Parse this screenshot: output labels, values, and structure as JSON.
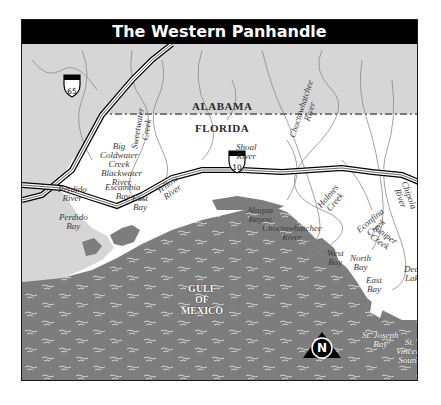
{
  "map": {
    "title": "The Western Panhandle",
    "states": {
      "north": "ALABAMA",
      "south": "FLORIDA"
    },
    "water_body": {
      "line1": "GULF",
      "line2": "OF",
      "line3": "MEXICO"
    },
    "highways": [
      {
        "id": "i65",
        "label": "65",
        "icon": "interstate-shield-icon"
      },
      {
        "id": "i10",
        "label": "10",
        "icon": "interstate-shield-icon"
      }
    ],
    "labels": {
      "big_coldwater_creek": {
        "l1": "Big",
        "l2": "Coldwater",
        "l3": "Creek"
      },
      "sweetwater_creek": {
        "l1": "Sweetwater",
        "l2": "Creek"
      },
      "blackwater_river": {
        "l1": "Blackwater",
        "l2": "River"
      },
      "shoal_river": {
        "l1": "Shoal",
        "l2": "River"
      },
      "choctawhatchee_river_north": {
        "l1": "Choctawhatchee",
        "l2": "River"
      },
      "perdido_river": {
        "l1": "Perdido",
        "l2": "River"
      },
      "perdido_bay": {
        "l1": "Perdido",
        "l2": "Bay"
      },
      "escambia_bay": {
        "l1": "Escambia",
        "l2": "Bay"
      },
      "east_bay_west": {
        "l1": "East",
        "l2": "Bay"
      },
      "yellow_river": {
        "l1": "Yellow",
        "l2": "River"
      },
      "alaqua_bayou": {
        "l1": "Alaqua",
        "l2": "Bayou"
      },
      "choctawhatchee_river_south": {
        "l1": "Choctawhatchee",
        "l2": "River"
      },
      "holmes_creek": {
        "l1": "Holmes",
        "l2": "Creek"
      },
      "econfina_creek": {
        "l1": "Econfina",
        "l2": "Creek"
      },
      "juniper_creek": {
        "l1": "Juniper",
        "l2": "Creek"
      },
      "chipola_river": {
        "l1": "Chipola",
        "l2": "River"
      },
      "west_bay": {
        "l1": "West",
        "l2": "Bay"
      },
      "north_bay": {
        "l1": "North",
        "l2": "Bay"
      },
      "east_bay_east": {
        "l1": "East",
        "l2": "Bay"
      },
      "dead_lake": {
        "l1": "Dead",
        "l2": "Lake"
      },
      "st_joseph_bay": {
        "l1": "St. Joseph",
        "l2": "Bay"
      },
      "st_vincent_sound": {
        "l1": "St.",
        "l2": "Vincent",
        "l3": "Sound"
      }
    },
    "compass": {
      "label": "N",
      "icon": "north-arrow-icon"
    },
    "colors": {
      "alabama_land": "#d6d6d6",
      "florida_land": "#ffffff",
      "water": "#7d7d7d",
      "border_dash": "#7a7a7a",
      "river": "#8a8a8a",
      "title_bg": "#000000",
      "title_fg": "#ffffff"
    }
  }
}
